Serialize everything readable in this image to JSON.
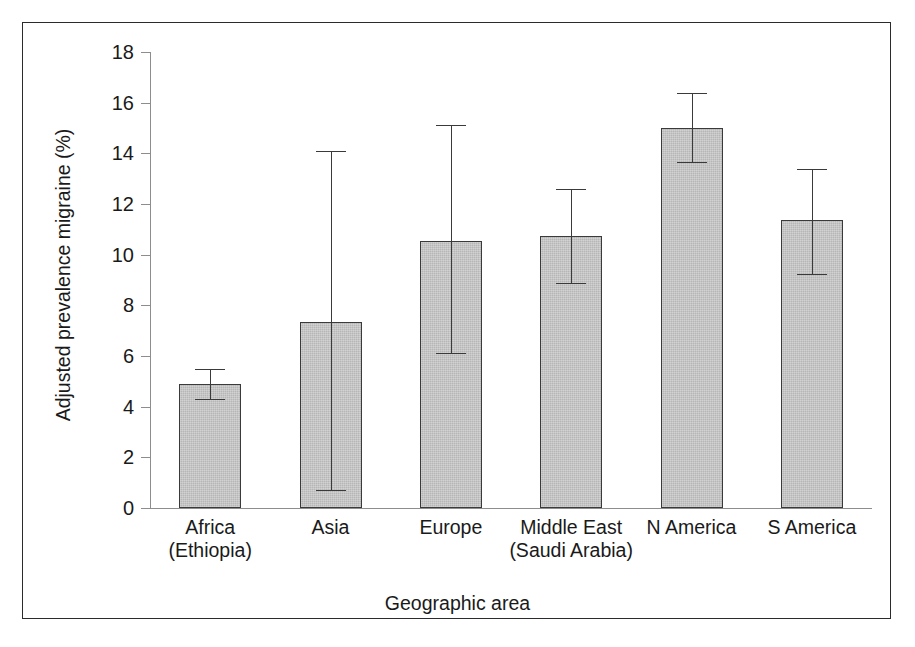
{
  "figure": {
    "frame_color": "#2b2b2b",
    "background": "#ffffff",
    "bar_fill": "#b6b6b6",
    "bar_stroke": "#3a3a3a",
    "axis_color": "#8d8d8d"
  },
  "chart_data": {
    "type": "bar",
    "title": "",
    "subtitle": "",
    "xlabel": "Geographic area",
    "ylabel": "Adjusted prevalence migraine (%)",
    "ylim": [
      0,
      18
    ],
    "yticks": [
      0,
      2,
      4,
      6,
      8,
      10,
      12,
      14,
      16,
      18
    ],
    "ytick_labels": [
      "0",
      "2",
      "4",
      "6",
      "8",
      "10",
      "12",
      "14",
      "16",
      "18"
    ],
    "grid": false,
    "legend": null,
    "error_bar_type": "95% confidence interval",
    "categories": [
      "Africa (Ethiopia)",
      "Asia",
      "Europe",
      "Middle East (Saudi Arabia)",
      "N America",
      "S America"
    ],
    "category_labels": [
      {
        "line1": "Africa",
        "line2": "(Ethiopia)"
      },
      {
        "line1": "Asia",
        "line2": ""
      },
      {
        "line1": "Europe",
        "line2": ""
      },
      {
        "line1": "Middle East",
        "line2": "(Saudi Arabia)"
      },
      {
        "line1": "N America",
        "line2": ""
      },
      {
        "line1": "S America",
        "line2": ""
      }
    ],
    "values": [
      4.9,
      7.35,
      10.55,
      10.75,
      15.0,
      11.35
    ],
    "error_low": [
      4.3,
      0.7,
      6.1,
      8.9,
      13.65,
      9.25
    ],
    "error_high": [
      5.5,
      14.1,
      15.1,
      12.6,
      16.4,
      13.4
    ],
    "value_labels": [
      "4.9",
      "7.4",
      "10.6",
      "10.8",
      "15.0",
      "11.4"
    ]
  }
}
